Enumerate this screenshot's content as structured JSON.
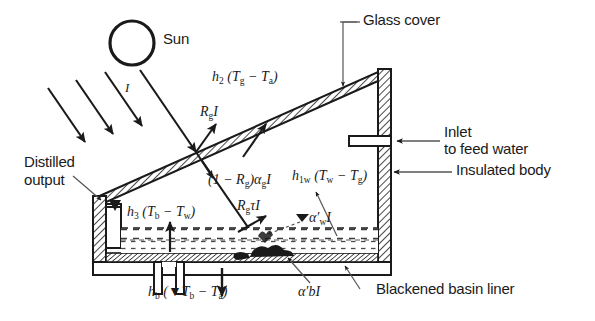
{
  "figure": {
    "type": "schematic-diagram",
    "background_color": "#ffffff",
    "line_color": "#1a1a1a"
  },
  "callouts": {
    "sun": "Sun",
    "glass_cover": "Glass cover",
    "inlet_line1": "Inlet",
    "inlet_line2": "to feed water",
    "insulated_body": "Insulated body",
    "distilled_line1": "Distilled",
    "distilled_line2": "output",
    "blackened_basin_liner": "Blackened basin liner"
  },
  "flux_labels": {
    "incident_radiation": "I",
    "glass_reflection": "R<sub>g</sub>I",
    "glass_absorption": "(1 &minus; R<sub>g</sub>)&alpha;<sub>g</sub>I",
    "glass_transmission": "R<sub>g</sub>&tau;I",
    "water_absorption": "&alpha;&prime;<sub>w</sub>I",
    "basin_absorption": "&alpha;&prime;bI",
    "convection_glass_ambient": "h<sub>2</sub> (T<sub>g</sub> &minus; T<sub>a</sub>)",
    "water_to_glass": "h<sub>1w</sub> (T<sub>w</sub> &minus; T<sub>g</sub>)",
    "basin_to_water": "h<sub>3</sub> (T<sub>b</sub> &minus; T<sub>w</sub>)",
    "bottom_loss": "h<sub>b</sub> (&#9660;T<sub>b</sub> &minus; T<sub>a</sub>)"
  },
  "flux_labels_plain": {
    "incident_radiation": "I",
    "glass_reflection": "Rg I",
    "glass_absorption": "(1 - Rg) alpha_g I",
    "glass_transmission": "Rg tau I",
    "water_absorption": "alpha'_w I",
    "basin_absorption": "alpha' b I",
    "convection_glass_ambient": "h2 (Tg - Ta)",
    "water_to_glass": "h1w (Tw - Tg)",
    "basin_to_water": "h3 (Tb - Tw)",
    "bottom_loss": "hb (triangle Tb - Ta)"
  }
}
